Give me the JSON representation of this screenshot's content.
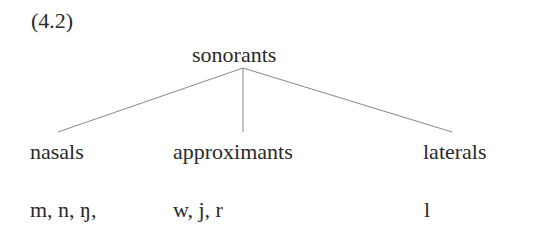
{
  "example_number": "(4.2)",
  "tree": {
    "root": "sonorants",
    "children": [
      {
        "label": "nasals",
        "members": "m, n, ŋ,"
      },
      {
        "label": "approximants",
        "members": "w, j, r"
      },
      {
        "label": "laterals",
        "members": "l"
      }
    ]
  },
  "colors": {
    "text": "#2a2a2a",
    "lines": "#888888"
  }
}
